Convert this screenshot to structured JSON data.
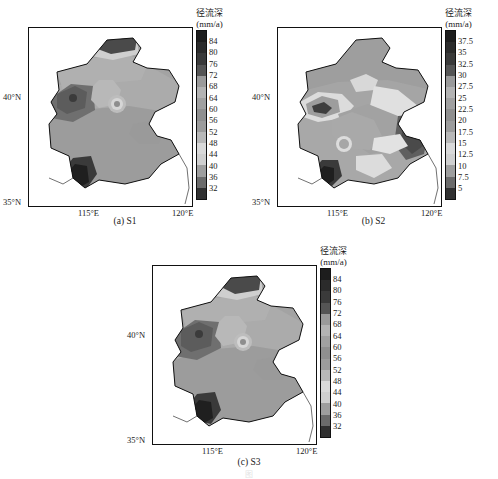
{
  "figure": {
    "caption_partial": "图",
    "panels": [
      {
        "id": "a",
        "label": "(a) S1",
        "legend": {
          "title": "径流深",
          "units": "(mm/a)"
        },
        "axis": {
          "x_ticks": [
            "115°E",
            "120°E"
          ],
          "y_ticks": [
            "40°N",
            "35°N"
          ]
        }
      },
      {
        "id": "b",
        "label": "(b) S2",
        "legend": {
          "title": "径流深",
          "units": "(mm/a)"
        },
        "axis": {
          "x_ticks": [
            "115°E",
            "120°E"
          ],
          "y_ticks": [
            "40°N",
            "35°N"
          ]
        }
      },
      {
        "id": "c",
        "label": "(c) S3",
        "legend": {
          "title": "径流深",
          "units": "(mm/a)"
        },
        "axis": {
          "x_ticks": [
            "115°E",
            "120°E"
          ],
          "y_ticks": [
            "40°N",
            "35°N"
          ]
        }
      }
    ]
  },
  "chart_data": [
    {
      "type": "heatmap",
      "title": "径流深 (mm/a)",
      "panel": "(a) S1",
      "xlabel": "",
      "ylabel": "",
      "x_tick_labels": [
        "115°E",
        "120°E"
      ],
      "y_tick_labels": [
        "40°N",
        "35°N"
      ],
      "xlim": [
        113.0,
        120.6
      ],
      "ylim": [
        34.6,
        42.8
      ],
      "colorbar": {
        "units": "mm/a",
        "tick_labels": [
          "84",
          "80",
          "76",
          "72",
          "68",
          "64",
          "60",
          "56",
          "52",
          "48",
          "44",
          "40",
          "36",
          "32"
        ],
        "levels": [
          32,
          36,
          40,
          44,
          48,
          52,
          56,
          60,
          64,
          68,
          72,
          76,
          80,
          84
        ],
        "n_bins": 14,
        "colors_top_to_bottom": [
          "#1d1d1d",
          "#2b2b2b",
          "#3a3a3a",
          "#555555",
          "#9a9a9a",
          "#b3b3b3",
          "#a0a0a0",
          "#8f8f8f",
          "#9c9c9c",
          "#b8b8b8",
          "#d9d9d9",
          "#cfcfcf",
          "#9e9e9e",
          "#6b6b6b",
          "#303030"
        ]
      },
      "regions": [
        {
          "name": "northern-border-high",
          "approx_value": 84,
          "shade": "#2e2e2e"
        },
        {
          "name": "northwest-high",
          "approx_value": 76,
          "shade": "#6f6f6f"
        },
        {
          "name": "central-plain",
          "approx_value": 60,
          "shade": "#a3a3a3"
        },
        {
          "name": "south-central-band",
          "approx_value": 56,
          "shade": "#9a9a9a"
        },
        {
          "name": "southwest-corner-high",
          "approx_value": 84,
          "shade": "#262626"
        },
        {
          "name": "inner-point-low",
          "approx_value": 44,
          "shade": "#d6d6d6"
        }
      ]
    },
    {
      "type": "heatmap",
      "title": "径流深 (mm/a)",
      "panel": "(b) S2",
      "xlabel": "",
      "ylabel": "",
      "x_tick_labels": [
        "115°E",
        "120°E"
      ],
      "y_tick_labels": [
        "40°N",
        "35°N"
      ],
      "xlim": [
        113.0,
        120.6
      ],
      "ylim": [
        34.6,
        42.8
      ],
      "colorbar": {
        "units": "mm/a",
        "tick_labels": [
          "37.5",
          "35",
          "32.5",
          "30",
          "27.5",
          "25",
          "22.5",
          "20",
          "17.5",
          "15",
          "12.5",
          "10",
          "7.5",
          "5"
        ],
        "levels": [
          5,
          7.5,
          10,
          12.5,
          15,
          17.5,
          20,
          22.5,
          25,
          27.5,
          30,
          32.5,
          35,
          37.5
        ],
        "n_bins": 14,
        "colors_top_to_bottom": [
          "#1d1d1d",
          "#2b2b2b",
          "#3a3a3a",
          "#555555",
          "#9a9a9a",
          "#b3b3b3",
          "#a0a0a0",
          "#8f8f8f",
          "#9c9c9c",
          "#b8b8b8",
          "#d9d9d9",
          "#cfcfcf",
          "#9e9e9e",
          "#6b6b6b",
          "#303030"
        ]
      },
      "regions": [
        {
          "name": "northern-plateau",
          "approx_value": 22.5,
          "shade": "#9e9e9e"
        },
        {
          "name": "northwest-dark-pocket",
          "approx_value": 32.5,
          "shade": "#4a4a4a"
        },
        {
          "name": "light-band-northwest",
          "approx_value": 12.5,
          "shade": "#e2e2e2"
        },
        {
          "name": "central-light-corridor",
          "approx_value": 12.5,
          "shade": "#e0e0e0"
        },
        {
          "name": "east-coast-high",
          "approx_value": 32.5,
          "shade": "#5a5a5a"
        },
        {
          "name": "southwest-corner-high",
          "approx_value": 37.5,
          "shade": "#242424"
        }
      ]
    },
    {
      "type": "heatmap",
      "title": "径流深 (mm/a)",
      "panel": "(c) S3",
      "xlabel": "",
      "ylabel": "",
      "x_tick_labels": [
        "115°E",
        "120°E"
      ],
      "y_tick_labels": [
        "40°N",
        "35°N"
      ],
      "xlim": [
        113.0,
        120.6
      ],
      "ylim": [
        34.6,
        42.8
      ],
      "colorbar": {
        "units": "mm/a",
        "tick_labels": [
          "84",
          "80",
          "76",
          "72",
          "68",
          "64",
          "60",
          "56",
          "52",
          "48",
          "44",
          "40",
          "36",
          "32"
        ],
        "levels": [
          32,
          36,
          40,
          44,
          48,
          52,
          56,
          60,
          64,
          68,
          72,
          76,
          80,
          84
        ],
        "n_bins": 14,
        "colors_top_to_bottom": [
          "#1d1d1d",
          "#2b2b2b",
          "#3a3a3a",
          "#555555",
          "#9a9a9a",
          "#b3b3b3",
          "#a0a0a0",
          "#8f8f8f",
          "#9c9c9c",
          "#b8b8b8",
          "#d9d9d9",
          "#cfcfcf",
          "#9e9e9e",
          "#6b6b6b",
          "#303030"
        ]
      },
      "regions": [
        {
          "name": "northern-border-high",
          "approx_value": 84,
          "shade": "#2e2e2e"
        },
        {
          "name": "northwest-high",
          "approx_value": 76,
          "shade": "#6f6f6f"
        },
        {
          "name": "central-plain",
          "approx_value": 60,
          "shade": "#a3a3a3"
        },
        {
          "name": "south-central-band",
          "approx_value": 56,
          "shade": "#9a9a9a"
        },
        {
          "name": "southwest-corner-high",
          "approx_value": 84,
          "shade": "#262626"
        },
        {
          "name": "inner-point-low",
          "approx_value": 44,
          "shade": "#d6d6d6"
        }
      ]
    }
  ]
}
